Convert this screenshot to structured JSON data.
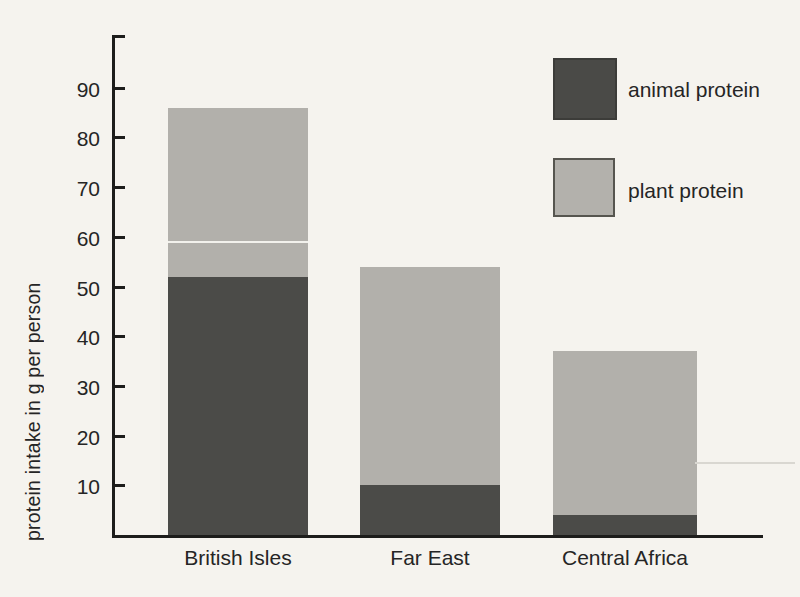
{
  "chart_data": {
    "type": "bar",
    "stacked": true,
    "title": "",
    "ylabel": "protein intake in g per person",
    "xlabel": "",
    "categories": [
      "British Isles",
      "Far East",
      "Central Africa"
    ],
    "series": [
      {
        "name": "animal protein",
        "color": "#4b4b48",
        "values": [
          52,
          10,
          4
        ]
      },
      {
        "name": "plant protein",
        "color": "#b2b0ab",
        "values": [
          34,
          44,
          33
        ]
      }
    ],
    "totals": [
      86,
      54,
      37
    ],
    "yticks": [
      10,
      20,
      30,
      40,
      50,
      60,
      70,
      80,
      90
    ],
    "ylim": [
      0,
      100
    ],
    "grid": false,
    "legend_position": "top-right"
  },
  "colors": {
    "background": "#f5f3ee",
    "axis": "#1d1d1b",
    "text": "#252525",
    "animal_protein": "#4b4b48",
    "plant_protein": "#b2b0ab"
  }
}
